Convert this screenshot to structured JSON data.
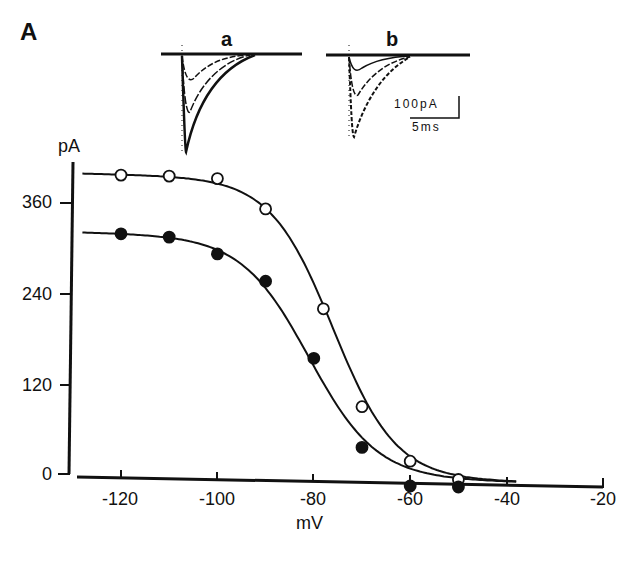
{
  "figure": {
    "panel_label": "A",
    "inset_a_label": "a",
    "inset_b_label": "b",
    "scale_bar_current": "100pA",
    "scale_bar_time": "5ms"
  },
  "chart_data": {
    "type": "scatter",
    "title": "",
    "xlabel": "mV",
    "ylabel": "pA",
    "xlim": [
      -130,
      -20
    ],
    "ylim": [
      0,
      420
    ],
    "xticks": [
      -120,
      -100,
      -80,
      -60,
      -40,
      -20
    ],
    "xtick_labels": [
      "-120",
      "-100",
      "-80",
      "-60",
      "-40",
      "-20"
    ],
    "yticks": [
      0,
      120,
      240,
      360
    ],
    "ytick_labels": [
      "0",
      "120",
      "240",
      "360"
    ],
    "grid": false,
    "legend": null,
    "series": [
      {
        "name": "open circles",
        "marker": "open-circle",
        "x": [
          -120,
          -110,
          -100,
          -90,
          -78,
          -70,
          -60,
          -50
        ],
        "y": [
          397,
          397,
          395,
          356,
          225,
          96,
          25,
          2
        ],
        "fit": "sigmoid",
        "fit_max": 398,
        "fit_v_half": -76,
        "fit_slope": 6.5
      },
      {
        "name": "filled circles",
        "marker": "filled-circle",
        "x": [
          -120,
          -110,
          -100,
          -90,
          -80,
          -70,
          -60,
          -50
        ],
        "y": [
          319,
          316,
          295,
          260,
          159,
          42,
          -8,
          -8
        ],
        "fit": "sigmoid",
        "fit_max": 320,
        "fit_v_half": -81,
        "fit_slope": 7
      }
    ],
    "insets": [
      {
        "label": "a",
        "description": "inward current traces at several voltages"
      },
      {
        "label": "b",
        "description": "inward current traces at several voltages"
      }
    ]
  },
  "colors": {
    "ink": "#111111",
    "background": "#ffffff"
  }
}
